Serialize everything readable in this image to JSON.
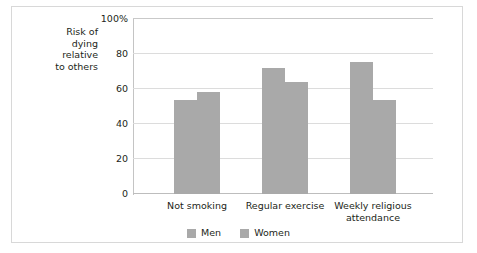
{
  "chart_data": {
    "type": "bar",
    "title": "",
    "subtitle": "",
    "xlabel": "",
    "ylabel": "Risk of\ndying\nrelative\nto others",
    "ylim": [
      0,
      100
    ],
    "yticks": [
      0,
      20,
      40,
      60,
      80,
      100
    ],
    "ytick_labels": [
      "0",
      "20",
      "40",
      "60",
      "80",
      "100%"
    ],
    "grid": true,
    "legend_position": "bottom-center",
    "categories": [
      "Not smoking",
      "Regular exercise",
      "Weekly religious\nattendance"
    ],
    "series": [
      {
        "name": "Men",
        "color": "#a9a9a9",
        "values": [
          54,
          72,
          75.5
        ]
      },
      {
        "name": "Women",
        "color": "#a9a9a9",
        "values": [
          58.5,
          64,
          53.5
        ]
      }
    ],
    "annotations": []
  },
  "legend": {
    "items": [
      {
        "label": "Men",
        "color": "#a9a9a9"
      },
      {
        "label": "Women",
        "color": "#a9a9a9"
      }
    ]
  },
  "style": {
    "bar_color": "#a9a9a9",
    "grid_color": "#dcdcdc",
    "axis_color": "#c4c4c4",
    "text_color": "#231f20",
    "frame_color": "#d8d8d8",
    "background": "#ffffff"
  }
}
